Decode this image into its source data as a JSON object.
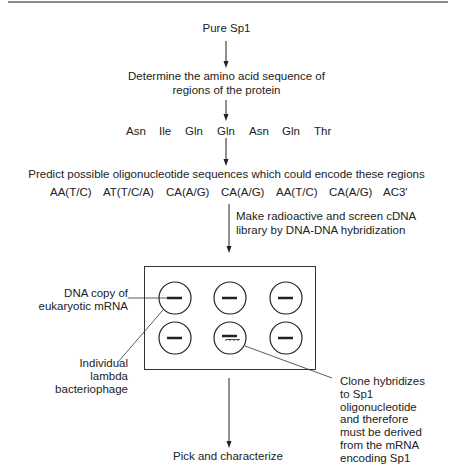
{
  "diagram": {
    "step1": "Pure Sp1",
    "step2_line1": "Determine the amino acid sequence of",
    "step2_line2": "regions of the protein",
    "amino_acids": [
      "Asn",
      "Ile",
      "Gln",
      "Gln",
      "Asn",
      "Gln",
      "Thr"
    ],
    "step3": "Predict possible oligonucleotide sequences which could encode these regions",
    "codons": [
      "AA(T/C)",
      "AT(T/C/A)",
      "CA(A/G)",
      "CA(A/G)",
      "AA(T/C)",
      "CA(A/G)",
      "AC3'"
    ],
    "step4_line1": "Make radioactive and screen cDNA",
    "step4_line2": "library by DNA-DNA hybridization",
    "label_dna_line1": "DNA copy of",
    "label_dna_line2": "eukaryotic mRNA",
    "label_phage_line1": "Individual",
    "label_phage_line2": "lambda",
    "label_phage_line3": "bacteriophage",
    "label_clone": [
      "Clone hybridizes",
      "to Sp1",
      "oligonucleotide",
      "and therefore",
      "must be derived",
      "from the mRNA",
      "encoding Sp1"
    ],
    "step5": "Pick and characterize"
  },
  "colors": {
    "ink": "#222222",
    "rule": "#555555"
  }
}
